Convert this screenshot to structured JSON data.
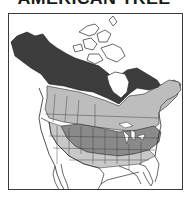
{
  "header": {
    "title": "AMERICAN TREE"
  },
  "map": {
    "region": "North America (Canada, USA, northern Mexico)",
    "legend_colors": {
      "dark_range": "#3d3d3d",
      "medium_range": "#8a8a8a",
      "light_range": "#bdbdbd",
      "no_range": "#ffffff",
      "borders": "#2a2a2a"
    },
    "zones": [
      {
        "name": "northern-boreal-dark",
        "color": "#3d3d3d"
      },
      {
        "name": "southern-canada-light",
        "color": "#bdbdbd"
      },
      {
        "name": "central-us-medium",
        "color": "#8a8a8a"
      },
      {
        "name": "southern-fringe-light",
        "color": "#c8c8c8"
      }
    ]
  }
}
